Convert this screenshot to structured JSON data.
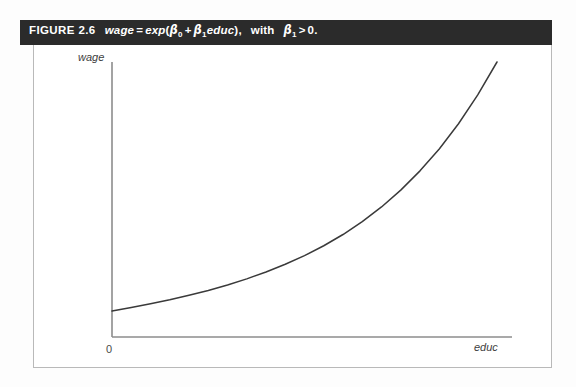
{
  "figure": {
    "number_label": "FIGURE 2.6",
    "caption_parts": {
      "dependent_var": "wage",
      "equals": "=",
      "function": "exp",
      "open_paren": "(",
      "beta": "β",
      "sub_zero": "0",
      "plus": "+",
      "sub_one": "1",
      "independent_var": "educ",
      "close_paren": ")",
      "comma": ",",
      "with_word": "with",
      "greater_than": ">",
      "zero_value": "0",
      "period": "."
    },
    "caption_plain": "FIGURE 2.6  wage = exp (β0 + β1educ), with β1 > 0."
  },
  "colors": {
    "caption_bar_bg": "#2b2b2b",
    "caption_text": "#ffffff",
    "frame_border": "#b9b9b9",
    "axis": "#8c8c8c",
    "curve": "#3a3a3a",
    "page_bg": "#fdfdfd",
    "plot_bg": "#ffffff"
  },
  "axes": {
    "y_label": "wage",
    "x_label": "educ",
    "origin_label": "0"
  },
  "chart_data": {
    "type": "line",
    "xlabel": "educ",
    "ylabel": "wage",
    "grid": false,
    "legend": "none",
    "xlim": [
      0,
      1
    ],
    "ylim": [
      0,
      1
    ],
    "annotations": [
      "0"
    ],
    "series": [
      {
        "name": "exp(beta0 + beta1*educ)",
        "description": "Increasing convex exponential curve of wage against educ",
        "x": [
          0.0,
          0.05,
          0.1,
          0.15,
          0.2,
          0.25,
          0.3,
          0.35,
          0.4,
          0.45,
          0.5,
          0.55,
          0.6,
          0.65,
          0.7,
          0.75,
          0.8,
          0.85,
          0.9,
          0.95,
          1.0
        ],
        "y": [
          0.095,
          0.108,
          0.122,
          0.137,
          0.154,
          0.172,
          0.192,
          0.215,
          0.241,
          0.27,
          0.302,
          0.339,
          0.381,
          0.429,
          0.484,
          0.547,
          0.619,
          0.701,
          0.795,
          0.903,
          1.026
        ]
      }
    ],
    "pixel_path": {
      "y_axis_x": 79,
      "x_axis_y": 292,
      "y_axis_top": 17,
      "x_axis_right": 479,
      "curve_start": [
        79,
        266
      ],
      "curve_end": [
        464,
        17
      ]
    }
  }
}
